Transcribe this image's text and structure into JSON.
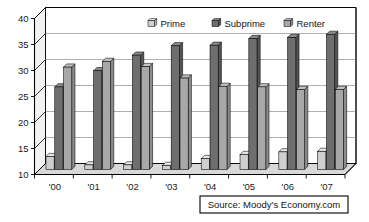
{
  "chart_data": {
    "type": "bar",
    "title": "",
    "xlabel": "",
    "ylabel": "",
    "ylim": [
      10,
      40
    ],
    "yticks": [
      10,
      15,
      20,
      25,
      30,
      35,
      40
    ],
    "ytick_labels": [
      "10",
      "15",
      "20",
      "25",
      "30",
      "35",
      "40"
    ],
    "grid": true,
    "legend_position": "top-center",
    "categories": [
      "'00",
      "'01",
      "'02",
      "'03",
      "'04",
      "'05",
      "'06",
      "'07"
    ],
    "series": [
      {
        "name": "Prime",
        "color": "#cfcfcf",
        "values": [
          12.5,
          10.9,
          10.9,
          10.8,
          12.1,
          12.9,
          13.4,
          13.5
        ]
      },
      {
        "name": "Subprime",
        "color": "#6e6e6e",
        "values": [
          25.9,
          29.0,
          32.0,
          33.8,
          33.9,
          35.2,
          35.4,
          36.0
        ]
      },
      {
        "name": "Renter",
        "color": "#a8a8a8",
        "values": [
          29.7,
          30.8,
          29.8,
          27.6,
          26.0,
          25.9,
          25.4,
          25.4
        ]
      }
    ],
    "annotations": [
      {
        "name": "source",
        "text": "Source: Moody's Economy.com"
      }
    ]
  },
  "legend": {
    "items": [
      {
        "label": "Prime",
        "swatch": "prime-swatch"
      },
      {
        "label": "Subprime",
        "swatch": "subprime-swatch"
      },
      {
        "label": "Renter",
        "swatch": "renter-swatch"
      }
    ]
  },
  "source_box": {
    "text": "Source: Moody's Economy.com"
  },
  "colors": {
    "prime": "#cfcfcf",
    "prime_side": "#b0b0b0",
    "prime_top": "#e6e6e6",
    "subprime": "#6e6e6e",
    "subprime_side": "#555555",
    "subprime_top": "#8a8a8a",
    "renter": "#a8a8a8",
    "renter_side": "#8c8c8c",
    "renter_top": "#c2c2c2",
    "frame": "#000000",
    "grid": "#9a9a9a",
    "plot_bg": "#ffffff",
    "floor": "#d8d8d8"
  }
}
